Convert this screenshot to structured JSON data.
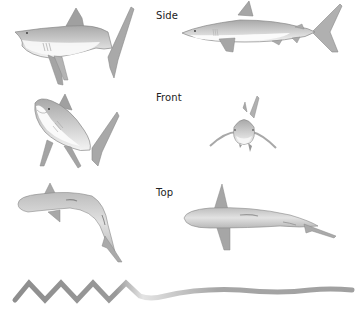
{
  "labels": {
    "side": "Side",
    "front": "Front",
    "top": "Top"
  },
  "colors": {
    "body_light": "#e8e8e8",
    "body_mid": "#c4c4c4",
    "body_dark": "#9a9a9a",
    "outline": "#7a7a7a",
    "belly": "#ffffff",
    "wave_dark": "#8c8c8c",
    "wave_light": "#e6e6e6"
  },
  "views": [
    {
      "name": "side",
      "left": "shark swimming, bent body, tail raised",
      "right": "shark side profile, straight"
    },
    {
      "name": "front",
      "left": "shark three-quarter front view",
      "right": "shark head-on front view"
    },
    {
      "name": "top",
      "left": "shark top view, curved body",
      "right": "shark top view, straight body"
    }
  ],
  "motion_path": {
    "description": "zigzag sawtooth transitioning into smooth gentle wave"
  }
}
